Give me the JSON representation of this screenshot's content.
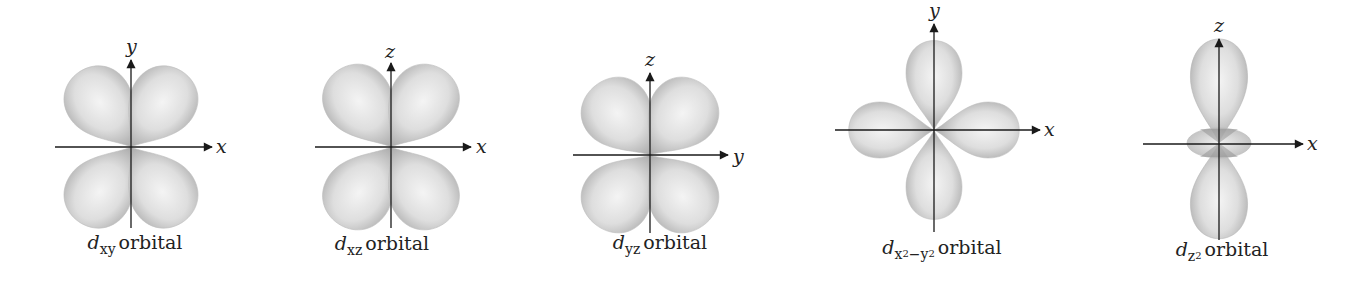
{
  "figure": {
    "panels": [
      {
        "id": "dxy",
        "axis_h": "x",
        "axis_v": "y",
        "caption_d": "d",
        "caption_sub": "xy",
        "caption_text": "orbital",
        "lobe_layout": "between-axes"
      },
      {
        "id": "dxz",
        "axis_h": "x",
        "axis_v": "z",
        "caption_d": "d",
        "caption_sub": "xz",
        "caption_text": "orbital",
        "lobe_layout": "between-axes"
      },
      {
        "id": "dyz",
        "axis_h": "y",
        "axis_v": "z",
        "caption_d": "d",
        "caption_sub": "yz",
        "caption_text": "orbital",
        "lobe_layout": "between-axes"
      },
      {
        "id": "dx2-y2",
        "axis_h": "x",
        "axis_v": "y",
        "caption_d": "d",
        "caption_sub_1": "x",
        "caption_sup_1": "2",
        "caption_minus": "−",
        "caption_sub_2": "y",
        "caption_sup_2": "2",
        "caption_text": "orbital",
        "lobe_layout": "along-axes"
      },
      {
        "id": "dz2",
        "axis_h": "x",
        "axis_v": "z",
        "caption_d": "d",
        "caption_sub": "z",
        "caption_sup": "2",
        "caption_text": "orbital",
        "lobe_layout": "dumbbell-with-torus"
      }
    ],
    "colors": {
      "lobe_fill_light": "#f2f2f2",
      "lobe_fill_dark": "#a8a8a8",
      "axis": "#1a1a1a",
      "background": "#ffffff"
    }
  }
}
